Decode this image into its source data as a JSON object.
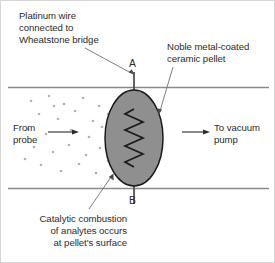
{
  "figure": {
    "colors": {
      "pellet_fill": "#8f8f8f",
      "pellet_stroke": "#1a1a1a",
      "tube_line": "#8a8a8a",
      "wire": "#4a4a4a",
      "leader": "#6f6f6f",
      "text": "#2b2b2b",
      "particle": "#b3b3b3",
      "border": "#d6d6d6"
    },
    "labels": {
      "platinum_wire": {
        "line1": "Platinum wire",
        "line2": "connected to",
        "line3": "Wheatstone bridge"
      },
      "noble_pellet": {
        "line1": "Noble metal-coated",
        "line2": "ceramic pellet"
      },
      "from_probe": {
        "line1": "From",
        "line2": "probe"
      },
      "to_vacuum": {
        "line1": "To vacuum",
        "line2": "pump"
      },
      "catalytic": {
        "line1": "Catalytic combustion",
        "line2": "of analytes occurs",
        "line3": "at pellet's surface"
      },
      "terminal_a": "A",
      "terminal_b": "B"
    }
  }
}
